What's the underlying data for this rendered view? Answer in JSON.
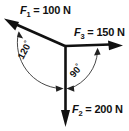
{
  "diagram": {
    "background_color": "#ffffff",
    "stroke_color": "#111111",
    "origin": {
      "x": 65,
      "y": 46
    },
    "forces": [
      {
        "id": "F1",
        "symbol": "F",
        "subscript": "1",
        "equals": "=",
        "magnitude": "100",
        "unit": "N",
        "label": "F1 = 100 N",
        "label_text": " = 100 N",
        "direction_deg": 150,
        "tip": {
          "x": 5,
          "y": 19
        }
      },
      {
        "id": "F3",
        "symbol": "F",
        "subscript": "3",
        "equals": "=",
        "magnitude": "150",
        "unit": "N",
        "label": "F3 = 150 N",
        "label_text": " = 150 N",
        "direction_deg": 0,
        "tip": {
          "x": 122,
          "y": 46
        }
      },
      {
        "id": "F2",
        "symbol": "F",
        "subscript": "2",
        "equals": "=",
        "magnitude": "200",
        "unit": "N",
        "label": "F2 = 200 N",
        "label_text": " = 200 N",
        "direction_deg": 270,
        "tip": {
          "x": 65,
          "y": 126
        }
      }
    ],
    "angles": [
      {
        "id": "angle-120",
        "value": "120",
        "degree_symbol": "°",
        "label": "120°",
        "between": [
          "F1",
          "F2"
        ],
        "side": "left",
        "text_rotation_deg": -62
      },
      {
        "id": "angle-90",
        "value": "90",
        "degree_symbol": "°",
        "label": "90°",
        "between": [
          "F2",
          "F3"
        ],
        "side": "right",
        "text_rotation_deg": -50
      }
    ]
  }
}
